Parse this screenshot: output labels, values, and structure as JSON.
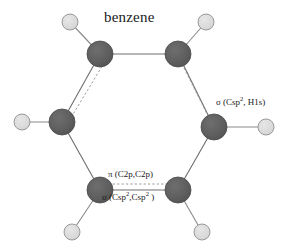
{
  "figure": {
    "title": "benzene",
    "background_color": "#ffffff",
    "width": 288,
    "height": 249
  },
  "molecule": {
    "name": "benzene",
    "formula": "C6H6",
    "colors": {
      "carbon_fill": "#5e5e5e",
      "carbon_stroke": "#4a4a4a",
      "hydrogen_fill": "#d9d9d9",
      "hydrogen_stroke": "#9a9a9a",
      "bond_stroke": "#6e6e6e",
      "pi_bond_stroke": "#8c8c8c",
      "text": "#1a1a1a"
    },
    "atoms": [
      {
        "id": "C1",
        "element": "C",
        "cx": 100,
        "cy": 54,
        "r": 13
      },
      {
        "id": "C2",
        "element": "C",
        "cx": 178,
        "cy": 54,
        "r": 13
      },
      {
        "id": "C3",
        "element": "C",
        "cx": 214,
        "cy": 127,
        "r": 13
      },
      {
        "id": "C4",
        "element": "C",
        "cx": 178,
        "cy": 190,
        "r": 13
      },
      {
        "id": "C5",
        "element": "C",
        "cx": 100,
        "cy": 190,
        "r": 13
      },
      {
        "id": "C6",
        "element": "C",
        "cx": 62,
        "cy": 122,
        "r": 13
      },
      {
        "id": "H1",
        "element": "H",
        "cx": 70,
        "cy": 22,
        "r": 8
      },
      {
        "id": "H2",
        "element": "H",
        "cx": 206,
        "cy": 22,
        "r": 8
      },
      {
        "id": "H3",
        "element": "H",
        "cx": 266,
        "cy": 127,
        "r": 8
      },
      {
        "id": "H4",
        "element": "H",
        "cx": 202,
        "cy": 232,
        "r": 8
      },
      {
        "id": "H5",
        "element": "H",
        "cx": 72,
        "cy": 232,
        "r": 8
      },
      {
        "id": "H6",
        "element": "H",
        "cx": 22,
        "cy": 122,
        "r": 8
      }
    ],
    "sigma_bonds": [
      {
        "from": "C1",
        "to": "C2",
        "x1": 100,
        "y1": 54,
        "x2": 178,
        "y2": 54
      },
      {
        "from": "C2",
        "to": "C3",
        "x1": 178,
        "y1": 54,
        "x2": 214,
        "y2": 127
      },
      {
        "from": "C3",
        "to": "C4",
        "x1": 214,
        "y1": 127,
        "x2": 178,
        "y2": 190
      },
      {
        "from": "C4",
        "to": "C5",
        "x1": 178,
        "y1": 190,
        "x2": 100,
        "y2": 190
      },
      {
        "from": "C5",
        "to": "C6",
        "x1": 100,
        "y1": 190,
        "x2": 62,
        "y2": 122
      },
      {
        "from": "C6",
        "to": "C1",
        "x1": 62,
        "y1": 122,
        "x2": 100,
        "y2": 54
      },
      {
        "from": "C1",
        "to": "H1",
        "x1": 100,
        "y1": 54,
        "x2": 70,
        "y2": 22
      },
      {
        "from": "C2",
        "to": "H2",
        "x1": 178,
        "y1": 54,
        "x2": 206,
        "y2": 22
      },
      {
        "from": "C3",
        "to": "H3",
        "x1": 214,
        "y1": 127,
        "x2": 266,
        "y2": 127
      },
      {
        "from": "C4",
        "to": "H4",
        "x1": 178,
        "y1": 190,
        "x2": 202,
        "y2": 232
      },
      {
        "from": "C5",
        "to": "H5",
        "x1": 100,
        "y1": 190,
        "x2": 72,
        "y2": 232
      },
      {
        "from": "C6",
        "to": "H6",
        "x1": 62,
        "y1": 122,
        "x2": 22,
        "y2": 122
      }
    ],
    "pi_bonds": [
      {
        "from": "C6",
        "to": "C1",
        "x1": 69,
        "y1": 121,
        "x2": 104,
        "y2": 63,
        "style": "dashed"
      },
      {
        "from": "C2",
        "to": "C3",
        "x1": 182,
        "y1": 64,
        "x2": 210,
        "y2": 120,
        "style": "dashed"
      },
      {
        "from": "C5",
        "to": "C4",
        "x1": 104,
        "y1": 184,
        "x2": 176,
        "y2": 184,
        "style": "dashed"
      }
    ]
  },
  "annotations": {
    "sigma_ch": {
      "prefix": "σ (Csp",
      "sup": "2",
      "suffix": ", H1s)",
      "full": "σ (Csp2, H1s)"
    },
    "pi_cc": {
      "full": "π (C2p,C2p)"
    },
    "sigma_cc": {
      "prefix": "σ (Csp",
      "sup1": "2",
      "middle": ",Csp",
      "sup2": "2",
      "suffix": " )",
      "full": "σ (Csp2,Csp2 )"
    }
  }
}
